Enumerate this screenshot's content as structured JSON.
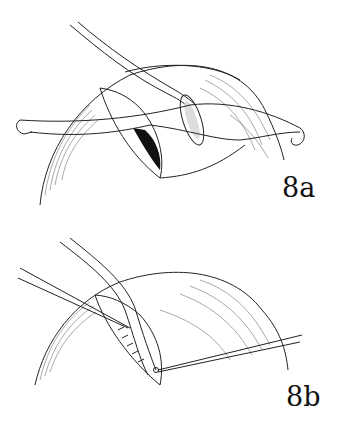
{
  "figure": {
    "panels": [
      {
        "id": "8a",
        "label": "8a",
        "description": "Surgical illustration: curved tube entering incision on a dome-shaped organ with sutures held by hooks on both sides; dark opening inside incision"
      },
      {
        "id": "8b",
        "label": "8b",
        "description": "Surgical illustration: tube passing through sutured incision on dome-shaped organ with suture threads extending left and right"
      }
    ]
  }
}
